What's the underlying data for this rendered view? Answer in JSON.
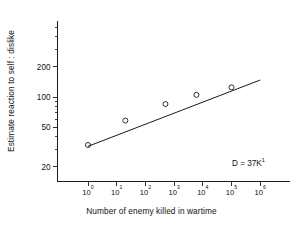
{
  "chart_data": {
    "type": "scatter",
    "title": "",
    "xlabel": "Number of enemy killed in wartime",
    "ylabel": "Estimate reaction to self : dislike",
    "xscale": "log",
    "yscale": "log",
    "xlim": [
      1,
      10000000
    ],
    "ylim": [
      15,
      330
    ],
    "grid": false,
    "legend": null,
    "xtick_labels": [
      "10",
      "10",
      "10",
      "10",
      "10",
      "10",
      "10"
    ],
    "xtick_exponents": [
      "0",
      "1",
      "2",
      "3",
      "4",
      "5",
      "6"
    ],
    "xtick_values": [
      1,
      10,
      100,
      1000,
      10000,
      100000,
      1000000
    ],
    "ytick_labels": [
      "200",
      "100",
      "50",
      "20"
    ],
    "ytick_values": [
      200,
      100,
      50,
      20
    ],
    "x": [
      1,
      20,
      500,
      6000,
      100000
    ],
    "y": [
      33,
      58,
      85,
      105,
      125
    ],
    "points": [
      {
        "x": 1,
        "y": 33
      },
      {
        "x": 20,
        "y": 58
      },
      {
        "x": 500,
        "y": 85
      },
      {
        "x": 6000,
        "y": 105
      },
      {
        "x": 100000,
        "y": 125
      }
    ],
    "marker": "open-circle",
    "fit_line": {
      "x_start": 1.0,
      "y_start": 32,
      "x_end": 1000000,
      "y_end": 148,
      "equation_label": "D = 37K",
      "equation_exponent": "1"
    },
    "annotations": [
      {
        "text": "D = 37K",
        "exponent": "1"
      }
    ]
  },
  "annotation": {
    "text": "D = 37K",
    "exponent": "1"
  },
  "axes": {
    "x_title": "Number of enemy killed in wartime",
    "y_title": "Estimate reaction to self : dislike"
  }
}
